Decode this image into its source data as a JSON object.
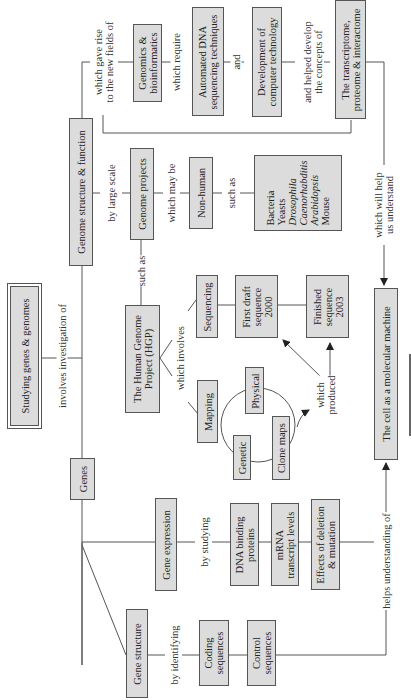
{
  "root": {
    "label": "Studying genes & genomes"
  },
  "links": {
    "involves": "involves investigation of",
    "by_large_scale": "by large scale",
    "such_as_1": "such as",
    "which_may_be": "which may be",
    "such_as_2": "such as",
    "gave_rise_1": "which gave rise",
    "gave_rise_2": "to the new fields of",
    "which_require": "which require",
    "and": "and",
    "helped_1": "and  helped develop",
    "helped_2": "the concepts of",
    "will_help_1": "which will help",
    "will_help_2": "us understand",
    "which_involves": "which involves",
    "produced_1": "which",
    "produced_2": "produced",
    "by_studying": "by studying",
    "by_identifying": "by identifying",
    "helps_understanding": "helps understanding of"
  },
  "nodes": {
    "genome_structure": "Genome structure & function",
    "genomics": [
      "Genomics &",
      "bioinformatics"
    ],
    "automated_dna": [
      "Automated DNA",
      "sequencing techniques"
    ],
    "computer_tech": [
      "Development of",
      "computer technology"
    ],
    "transcriptome": [
      "The transcriptome,",
      "proteome & interactome"
    ],
    "genome_projects": "Genome projects",
    "non_human": "Non-human",
    "organisms": [
      "Bacteria",
      "Yeasts",
      "Drosophila",
      "Caenorhabditis",
      "Arabidopsis",
      "Mouse"
    ],
    "hgp": [
      "The Human Genome",
      "Project (HGP)"
    ],
    "sequencing": "Sequencing",
    "first_draft": [
      "First draft",
      "sequence",
      "2000"
    ],
    "finished": [
      "Finished",
      "sequence",
      "2003"
    ],
    "mapping": "Mapping",
    "physical": "Physical",
    "genetic": "Genetic",
    "clone_maps": "Clone maps",
    "cell_machine": "The cell as a molecular machine",
    "genes": "Genes",
    "gene_expression": "Gene expression",
    "dna_binding": [
      "DNA binding",
      "proteins"
    ],
    "mrna": [
      "mRNA",
      "transcript levels"
    ],
    "effects": [
      "Effects of deletion",
      "& mutation"
    ],
    "gene_structure": "Gene structure",
    "coding": [
      "Coding",
      "sequences"
    ],
    "control": [
      "Control",
      "sequences"
    ]
  },
  "colors": {
    "box_fill": "#dcdcdc",
    "line": "#555555",
    "background": "#ffffff"
  }
}
